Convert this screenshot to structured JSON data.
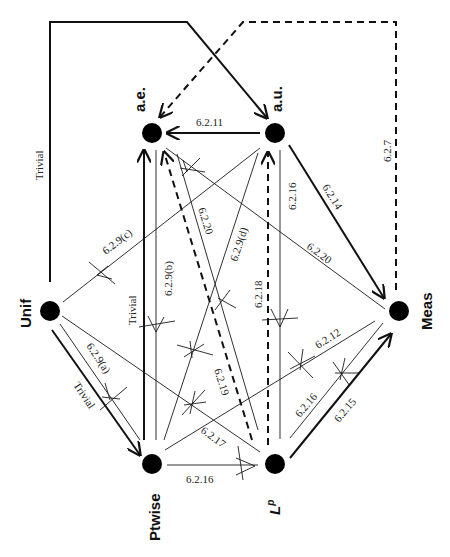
{
  "nodes": {
    "ae": {
      "label": "a.e."
    },
    "au": {
      "label": "a.u."
    },
    "unif": {
      "label": "Unif"
    },
    "meas": {
      "label": "Meas"
    },
    "ptwise": {
      "label": "Ptwise"
    },
    "lp": {
      "label": "L",
      "sup": "p"
    }
  },
  "edges": {
    "unif_au": {
      "label": "Trivial",
      "style": "thick",
      "from": "Unif",
      "to": "a.u."
    },
    "meas_ae": {
      "label": "6.2.7",
      "style": "dashed",
      "from": "Meas",
      "to": "a.e."
    },
    "au_ae": {
      "label": "6.2.11",
      "style": "thick",
      "from": "a.u.",
      "to": "a.e."
    },
    "au_meas": {
      "label": "6.2.14",
      "style": "thick",
      "from": "a.u.",
      "to": "Meas"
    },
    "ae_meas": {
      "label": "6.2.20",
      "style": "thin",
      "from": "a.e.",
      "to": "Meas"
    },
    "au_lp": {
      "label": "6.2.16",
      "style": "thin-crossed"
    },
    "lp_au": {
      "label": "6.2.18",
      "style": "dashed"
    },
    "unif_au_c": {
      "label": "6.2.9(c)",
      "style": "thin-crossed"
    },
    "ptwise_ae": {
      "label": "Trivial",
      "style": "thick"
    },
    "ae_ptwise": {
      "label": "6.2.9(b)",
      "style": "thin-crossed"
    },
    "ae_lp": {
      "label": "6.2.20",
      "style": "thin-crossed"
    },
    "ptwise_au": {
      "label": "6.2.9(d)",
      "style": "thin-crossed"
    },
    "lp_ae": {
      "label": "6.2.19",
      "style": "dashed"
    },
    "unif_ptwise_a": {
      "label": "6.2.9(a)",
      "style": "thin-crossed"
    },
    "unif_ptwise": {
      "label": "Trivial",
      "style": "thick"
    },
    "unif_lp": {
      "label": "6.2.17",
      "style": "thin-crossed"
    },
    "ptwise_meas": {
      "label": "6.2.12",
      "style": "thin-crossed"
    },
    "meas_lp": {
      "label": "6.2.16",
      "style": "thin-crossed"
    },
    "lp_meas": {
      "label": "6.2.15",
      "style": "thick"
    },
    "ptwise_lp": {
      "label": "6.2.16",
      "style": "thin-crossed"
    }
  }
}
